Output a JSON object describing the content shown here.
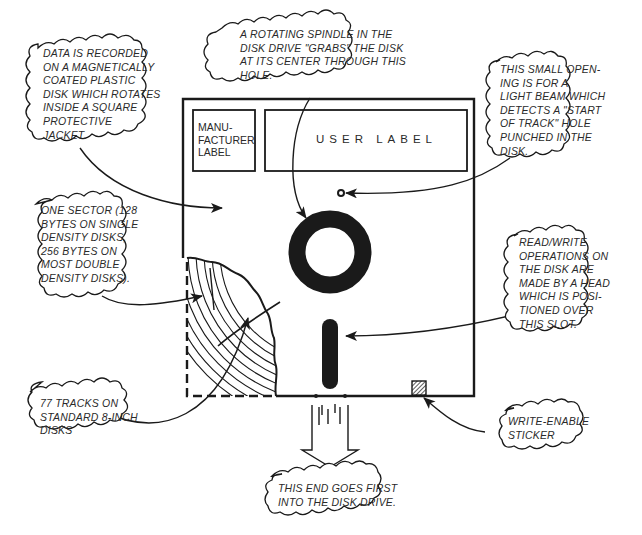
{
  "diagram": {
    "type": "annotated technical illustration",
    "colors": {
      "ink": "#1a1a1a",
      "paper": "#ffffff",
      "text": "#2a2a2a"
    }
  },
  "labels": {
    "manufacturer_label": "MANU-\nFACTURER\nLABEL",
    "user_label": "USER LABEL"
  },
  "callouts": {
    "data_recorded": "DATA IS RECORDED\nON A MAGNETICALLY\nCOATED PLASTIC\nDISK WHICH ROTATES\nINSIDE A SQUARE\nPROTECTIVE\nJACKET.",
    "spindle": "A ROTATING SPINDLE IN THE\nDISK DRIVE \"GRABS\" THE DISK\nAT ITS CENTER THROUGH THIS\nHOLE.",
    "index_hole": "THIS SMALL OPEN-\nING IS FOR A\nLIGHT BEAM WHICH\nDETECTS A \"START\nOF TRACK\" HOLE\nPUNCHED IN THE\nDISK.",
    "sector": "ONE SECTOR (128\nBYTES ON SINGLE\nDENSITY DISKS,\n256 BYTES ON\nMOST DOUBLE\nDENSITY DISKS).",
    "read_write": "READ/WRITE\nOPERATIONS ON\nTHE DISK ARE\nMADE BY A HEAD\nWHICH IS POSI-\nTIONED OVER\nTHIS SLOT.",
    "tracks": "77 TRACKS ON\nSTANDARD 8-INCH\nDISKS",
    "write_enable": "WRITE-ENABLE\nSTICKER",
    "insert_end": "THIS END GOES FIRST\nINTO THE DISK DRIVE."
  }
}
